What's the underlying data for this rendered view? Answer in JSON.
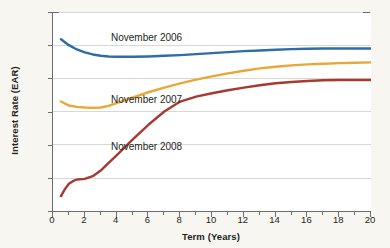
{
  "chart_data": {
    "type": "line",
    "title": "",
    "xlabel": "Term (Years)",
    "ylabel": "Interest Rate (EAR)",
    "xlim": [
      0,
      20
    ],
    "ylim": [
      0,
      6
    ],
    "x_ticks": [
      0,
      2,
      4,
      6,
      8,
      10,
      12,
      14,
      16,
      18,
      20
    ],
    "x_tick_labels": [
      "0",
      "2",
      "4",
      "6",
      "8",
      "10",
      "12",
      "14",
      "16",
      "18",
      "20"
    ],
    "x_minor_ticks": [
      1,
      3,
      5,
      7,
      9,
      11,
      13,
      15,
      17,
      19
    ],
    "y_ticks": [
      0,
      1,
      2,
      3,
      4,
      5,
      6
    ],
    "y_tick_labels": [
      "0%",
      "1%",
      "2%",
      "3%",
      "4%",
      "5%",
      "6%"
    ],
    "grid": "horizontal",
    "legend": "inline-annotations",
    "plot_background": "#ffffff",
    "figure_background": "#f7f6f1",
    "axis_color": "#6d6d6d",
    "grid_color": "#d8d8d8",
    "series": [
      {
        "name": "November 2006",
        "color": "#2e6da8",
        "label_position": "upper-left",
        "x": [
          0.5,
          1,
          1.5,
          2,
          2.5,
          3,
          3.5,
          4,
          5,
          6,
          7,
          8,
          9,
          10,
          11,
          12,
          13,
          14,
          15,
          16,
          17,
          18,
          19,
          20
        ],
        "values": [
          5.18,
          5.0,
          4.87,
          4.78,
          4.72,
          4.68,
          4.66,
          4.65,
          4.65,
          4.66,
          4.68,
          4.7,
          4.73,
          4.76,
          4.79,
          4.82,
          4.84,
          4.86,
          4.88,
          4.89,
          4.9,
          4.9,
          4.9,
          4.9
        ]
      },
      {
        "name": "November 2007",
        "color": "#e8a838",
        "label_position": "middle-left",
        "x": [
          0.5,
          1,
          1.5,
          2,
          2.5,
          3,
          3.5,
          4,
          5,
          6,
          7,
          8,
          9,
          10,
          11,
          12,
          13,
          14,
          15,
          16,
          17,
          18,
          19,
          20
        ],
        "values": [
          3.3,
          3.18,
          3.14,
          3.12,
          3.11,
          3.12,
          3.17,
          3.25,
          3.42,
          3.58,
          3.72,
          3.85,
          3.96,
          4.06,
          4.15,
          4.23,
          4.3,
          4.35,
          4.39,
          4.42,
          4.44,
          4.46,
          4.47,
          4.48
        ]
      },
      {
        "name": "November 2008",
        "color": "#a63a30",
        "label_position": "lower-left",
        "x": [
          0.5,
          0.75,
          1,
          1.25,
          1.5,
          2,
          2.5,
          3,
          3.5,
          4,
          5,
          6,
          7,
          8,
          9,
          10,
          11,
          12,
          13,
          14,
          15,
          16,
          17,
          18,
          19,
          20
        ],
        "values": [
          0.45,
          0.66,
          0.82,
          0.9,
          0.95,
          0.97,
          1.05,
          1.22,
          1.45,
          1.68,
          2.15,
          2.6,
          3.0,
          3.3,
          3.45,
          3.55,
          3.64,
          3.72,
          3.79,
          3.85,
          3.89,
          3.92,
          3.94,
          3.95,
          3.95,
          3.95
        ]
      }
    ]
  }
}
